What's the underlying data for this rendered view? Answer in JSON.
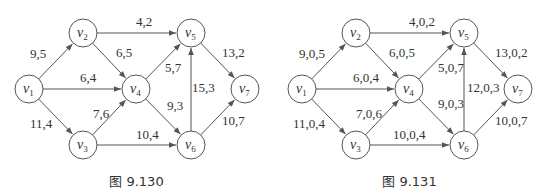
{
  "figures": [
    {
      "caption": "图 9.130",
      "nodes": [
        {
          "id": "v1",
          "base": "v",
          "sub": "1",
          "x": 29,
          "y": 89
        },
        {
          "id": "v2",
          "base": "v",
          "sub": "2",
          "x": 83,
          "y": 33
        },
        {
          "id": "v3",
          "base": "v",
          "sub": "3",
          "x": 83,
          "y": 145
        },
        {
          "id": "v4",
          "base": "v",
          "sub": "4",
          "x": 136,
          "y": 89
        },
        {
          "id": "v5",
          "base": "v",
          "sub": "5",
          "x": 191,
          "y": 33
        },
        {
          "id": "v6",
          "base": "v",
          "sub": "6",
          "x": 191,
          "y": 145
        },
        {
          "id": "v7",
          "base": "v",
          "sub": "7",
          "x": 245,
          "y": 89
        }
      ],
      "edges": [
        {
          "from": "v1",
          "to": "v2",
          "label": "9,5",
          "lx": 30,
          "ly": 58
        },
        {
          "from": "v1",
          "to": "v4",
          "label": "6,4",
          "lx": 80,
          "ly": 82
        },
        {
          "from": "v1",
          "to": "v3",
          "label": "11,4",
          "lx": 30,
          "ly": 128
        },
        {
          "from": "v2",
          "to": "v5",
          "label": "4,2",
          "lx": 136,
          "ly": 26
        },
        {
          "from": "v2",
          "to": "v4",
          "label": "6,5",
          "lx": 116,
          "ly": 57
        },
        {
          "from": "v3",
          "to": "v4",
          "label": "7,6",
          "lx": 93,
          "ly": 118
        },
        {
          "from": "v3",
          "to": "v6",
          "label": "10,4",
          "lx": 136,
          "ly": 139
        },
        {
          "from": "v4",
          "to": "v5",
          "label": "5,7",
          "lx": 165,
          "ly": 72
        },
        {
          "from": "v4",
          "to": "v6",
          "label": "9,3",
          "lx": 167,
          "ly": 110
        },
        {
          "from": "v6",
          "to": "v5",
          "label": "15,3",
          "lx": 192,
          "ly": 92
        },
        {
          "from": "v5",
          "to": "v7",
          "label": "13,2",
          "lx": 222,
          "ly": 57
        },
        {
          "from": "v6",
          "to": "v7",
          "label": "10,7",
          "lx": 222,
          "ly": 125
        }
      ]
    },
    {
      "caption": "图 9.131",
      "nodes": [
        {
          "id": "v1",
          "base": "v",
          "sub": "1",
          "x": 29,
          "y": 89
        },
        {
          "id": "v2",
          "base": "v",
          "sub": "2",
          "x": 83,
          "y": 33
        },
        {
          "id": "v3",
          "base": "v",
          "sub": "3",
          "x": 83,
          "y": 145
        },
        {
          "id": "v4",
          "base": "v",
          "sub": "4",
          "x": 136,
          "y": 89
        },
        {
          "id": "v5",
          "base": "v",
          "sub": "5",
          "x": 191,
          "y": 33
        },
        {
          "id": "v6",
          "base": "v",
          "sub": "6",
          "x": 191,
          "y": 145
        },
        {
          "id": "v7",
          "base": "v",
          "sub": "7",
          "x": 245,
          "y": 89
        }
      ],
      "edges": [
        {
          "from": "v1",
          "to": "v2",
          "label": "9,0,5",
          "lx": 26,
          "ly": 58
        },
        {
          "from": "v1",
          "to": "v4",
          "label": "6,0,4",
          "lx": 80,
          "ly": 82
        },
        {
          "from": "v1",
          "to": "v3",
          "label": "11,0,4",
          "lx": 20,
          "ly": 128
        },
        {
          "from": "v2",
          "to": "v5",
          "label": "4,0,2",
          "lx": 136,
          "ly": 26
        },
        {
          "from": "v2",
          "to": "v4",
          "label": "6,0,5",
          "lx": 116,
          "ly": 57
        },
        {
          "from": "v3",
          "to": "v4",
          "label": "7,0,6",
          "lx": 83,
          "ly": 118
        },
        {
          "from": "v3",
          "to": "v6",
          "label": "10,0,4",
          "lx": 120,
          "ly": 139
        },
        {
          "from": "v4",
          "to": "v5",
          "label": "5,0,7",
          "lx": 165,
          "ly": 72
        },
        {
          "from": "v4",
          "to": "v6",
          "label": "9,0,3",
          "lx": 165,
          "ly": 108
        },
        {
          "from": "v6",
          "to": "v5",
          "label": "12,0,3",
          "lx": 194,
          "ly": 92
        },
        {
          "from": "v5",
          "to": "v7",
          "label": "13,0,2",
          "lx": 222,
          "ly": 57
        },
        {
          "from": "v6",
          "to": "v7",
          "label": "10,0,7",
          "lx": 222,
          "ly": 125
        }
      ]
    }
  ],
  "style": {
    "node_radius": 14,
    "stroke_color": "#555555",
    "text_color": "#333333"
  }
}
